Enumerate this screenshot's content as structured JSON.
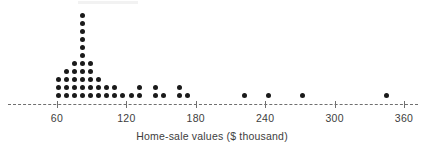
{
  "chart_data": {
    "type": "scatter",
    "plot_style": "dotplot",
    "title": "",
    "xlabel": "Home-sale values ($ thousand)",
    "ylabel": "",
    "grid": false,
    "legend": null,
    "xlim": [
      40,
      370
    ],
    "axis_tick_labels": [
      "60",
      "120",
      "180",
      "240",
      "300",
      "360"
    ],
    "axis_ticks": [
      60,
      120,
      180,
      240,
      300,
      360
    ],
    "axis_style": "dashed",
    "dot_color": "#1a1a1a",
    "axis_color": "#6f6f6f",
    "x": [
      61,
      61,
      61,
      68,
      68,
      68,
      68,
      75,
      75,
      75,
      75,
      75,
      82,
      82,
      82,
      82,
      82,
      82,
      82,
      82,
      82,
      82,
      82,
      89,
      89,
      89,
      89,
      89,
      96,
      96,
      96,
      103,
      103,
      110,
      110,
      117,
      124,
      131,
      131,
      145,
      145,
      152,
      166,
      166,
      173,
      222,
      243,
      272,
      345
    ],
    "counts_by_value": [
      {
        "value": 61,
        "count": 3
      },
      {
        "value": 68,
        "count": 4
      },
      {
        "value": 75,
        "count": 5
      },
      {
        "value": 82,
        "count": 11
      },
      {
        "value": 89,
        "count": 5
      },
      {
        "value": 96,
        "count": 3
      },
      {
        "value": 103,
        "count": 2
      },
      {
        "value": 110,
        "count": 2
      },
      {
        "value": 117,
        "count": 1
      },
      {
        "value": 124,
        "count": 1
      },
      {
        "value": 131,
        "count": 2
      },
      {
        "value": 145,
        "count": 2
      },
      {
        "value": 152,
        "count": 1
      },
      {
        "value": 166,
        "count": 2
      },
      {
        "value": 173,
        "count": 1
      },
      {
        "value": 222,
        "count": 1
      },
      {
        "value": 243,
        "count": 1
      },
      {
        "value": 272,
        "count": 1
      },
      {
        "value": 345,
        "count": 1
      }
    ],
    "total_dots": 49
  }
}
